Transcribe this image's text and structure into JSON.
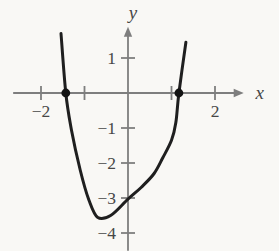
{
  "figure": {
    "background": "#f9f8f5"
  },
  "chart_data": {
    "type": "line",
    "title": "",
    "xlabel": "x",
    "ylabel": "y",
    "grid": false,
    "xlim": [
      -2.64,
      2.66
    ],
    "ylim": [
      -4.51,
      1.89
    ],
    "x_ticks": [
      {
        "v": -2,
        "label": "−2"
      },
      {
        "v": -1,
        "label": ""
      },
      {
        "v": 1,
        "label": ""
      },
      {
        "v": 2,
        "label": "2"
      }
    ],
    "y_ticks": [
      {
        "v": 1,
        "label": "1"
      },
      {
        "v": -1,
        "label": "−1"
      },
      {
        "v": -2,
        "label": "−2"
      },
      {
        "v": -3,
        "label": "−3"
      },
      {
        "v": -4,
        "label": "−4"
      }
    ],
    "series": [
      {
        "name": "curve",
        "points": [
          [
            -1.54,
            1.7
          ],
          [
            -1.43,
            0
          ],
          [
            -1.3,
            -1.05
          ],
          [
            -1.1,
            -2.2
          ],
          [
            -0.9,
            -3.05
          ],
          [
            -0.7,
            -3.55
          ],
          [
            -0.4,
            -3.5
          ],
          [
            0,
            -3.03
          ],
          [
            0.3,
            -2.7
          ],
          [
            0.6,
            -2.3
          ],
          [
            0.8,
            -1.85
          ],
          [
            1.0,
            -1.35
          ],
          [
            1.1,
            -0.85
          ],
          [
            1.17,
            0
          ],
          [
            1.33,
            1.45
          ]
        ]
      }
    ],
    "marked_points": [
      [
        -1.43,
        0
      ],
      [
        1.17,
        0
      ]
    ],
    "colors": {
      "axis": "#7e7e7e",
      "curve": "#1f1f1f",
      "point": "#131313",
      "text": "#474747"
    },
    "plot": {
      "origin_px": [
        128,
        93
      ],
      "px_per_unit": [
        43.5,
        35
      ]
    }
  }
}
